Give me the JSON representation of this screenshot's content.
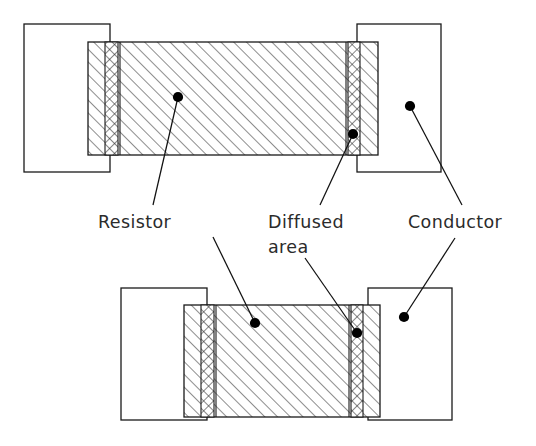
{
  "figure": {
    "background_color": "#ffffff",
    "line_color": "#1a1a1a",
    "hatch_color": "#3a3a3a",
    "text_color": "#2b2b2b",
    "dot_color": "#000000",
    "width": 536,
    "height": 446
  },
  "labels": {
    "resistor": "Resistor",
    "diffused_line1": "Diffused",
    "diffused_line2": "area",
    "conductor": "Conductor"
  },
  "views": [
    {
      "id": "top-view",
      "name": "top-construction-view",
      "conductor_left": {
        "x": 24,
        "y": 24,
        "width": 86,
        "height": 148
      },
      "conductor_right": {
        "x": 357,
        "y": 24,
        "width": 84,
        "height": 148
      },
      "resistor_body": {
        "x": 88,
        "y": 42,
        "width": 290,
        "height": 113
      },
      "diffused_bands": [
        {
          "x": 105,
          "y": 42,
          "width": 13,
          "height": 113
        },
        {
          "x": 348,
          "y": 42,
          "width": 12,
          "height": 113
        }
      ]
    },
    {
      "id": "bottom-view",
      "name": "bottom-construction-view",
      "conductor_left": {
        "x": 121,
        "y": 288,
        "width": 86,
        "height": 132
      },
      "conductor_right": {
        "x": 368,
        "y": 288,
        "width": 84,
        "height": 132
      },
      "resistor_body": {
        "x": 184,
        "y": 305,
        "width": 196,
        "height": 112
      },
      "diffused_bands": [
        {
          "x": 201,
          "y": 305,
          "width": 13,
          "height": 112
        },
        {
          "x": 351,
          "y": 305,
          "width": 12,
          "height": 112
        }
      ]
    }
  ],
  "leaders": [
    {
      "name": "resistor-leader-top",
      "dot": {
        "x": 178,
        "y": 97
      },
      "path": "M 178,97 L 153,205"
    },
    {
      "name": "resistor-leader-bottom",
      "dot": {
        "x": 255,
        "y": 323
      },
      "path": "M 255,323 L 213,237"
    },
    {
      "name": "diffused-leader-top",
      "dot": {
        "x": 353,
        "y": 134
      },
      "path": "M 353,134 L 320,205"
    },
    {
      "name": "diffused-leader-bottom",
      "dot": {
        "x": 357,
        "y": 333
      },
      "path": "M 357,333 L 305,258"
    },
    {
      "name": "conductor-leader-top",
      "dot": {
        "x": 410,
        "y": 106
      },
      "path": "M 410,106 L 462,205"
    },
    {
      "name": "conductor-leader-bottom",
      "dot": {
        "x": 404,
        "y": 317
      },
      "path": "M 404,317 L 455,238"
    }
  ],
  "label_positions": {
    "resistor": {
      "x": 98,
      "y": 228
    },
    "diffused_line1": {
      "x": 268,
      "y": 228
    },
    "diffused_line2": {
      "x": 268,
      "y": 253
    },
    "conductor": {
      "x": 408,
      "y": 228
    }
  }
}
